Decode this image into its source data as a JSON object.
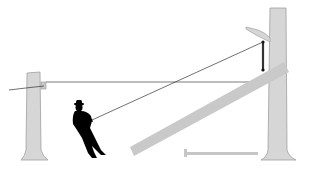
{
  "diagram": {
    "colors": {
      "background": "#ffffff",
      "trunk_fill": "#d4d4d4",
      "trunk_stroke": "#9a9a9a",
      "log_fill": "#c8c8c8",
      "rope": "#333333",
      "figure": "#000000",
      "bar": "#c4c4c4"
    },
    "elements": [
      {
        "name": "left-post",
        "label": ""
      },
      {
        "name": "anchor-block",
        "label": ""
      },
      {
        "name": "right-tree",
        "label": ""
      },
      {
        "name": "branch-hook",
        "label": ""
      },
      {
        "name": "pulley",
        "label": ""
      },
      {
        "name": "leaning-log",
        "label": ""
      },
      {
        "name": "horizontal-rope",
        "label": ""
      },
      {
        "name": "pull-rope",
        "label": ""
      },
      {
        "name": "person-silhouette",
        "label": ""
      },
      {
        "name": "ground-bar",
        "label": ""
      }
    ]
  }
}
